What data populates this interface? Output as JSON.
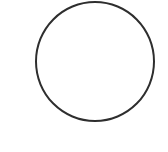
{
  "shape": {
    "type": "circle",
    "stroke_color": "#2e2e2e",
    "fill": "none",
    "center": [
      94,
      61
    ],
    "radius": 59
  }
}
